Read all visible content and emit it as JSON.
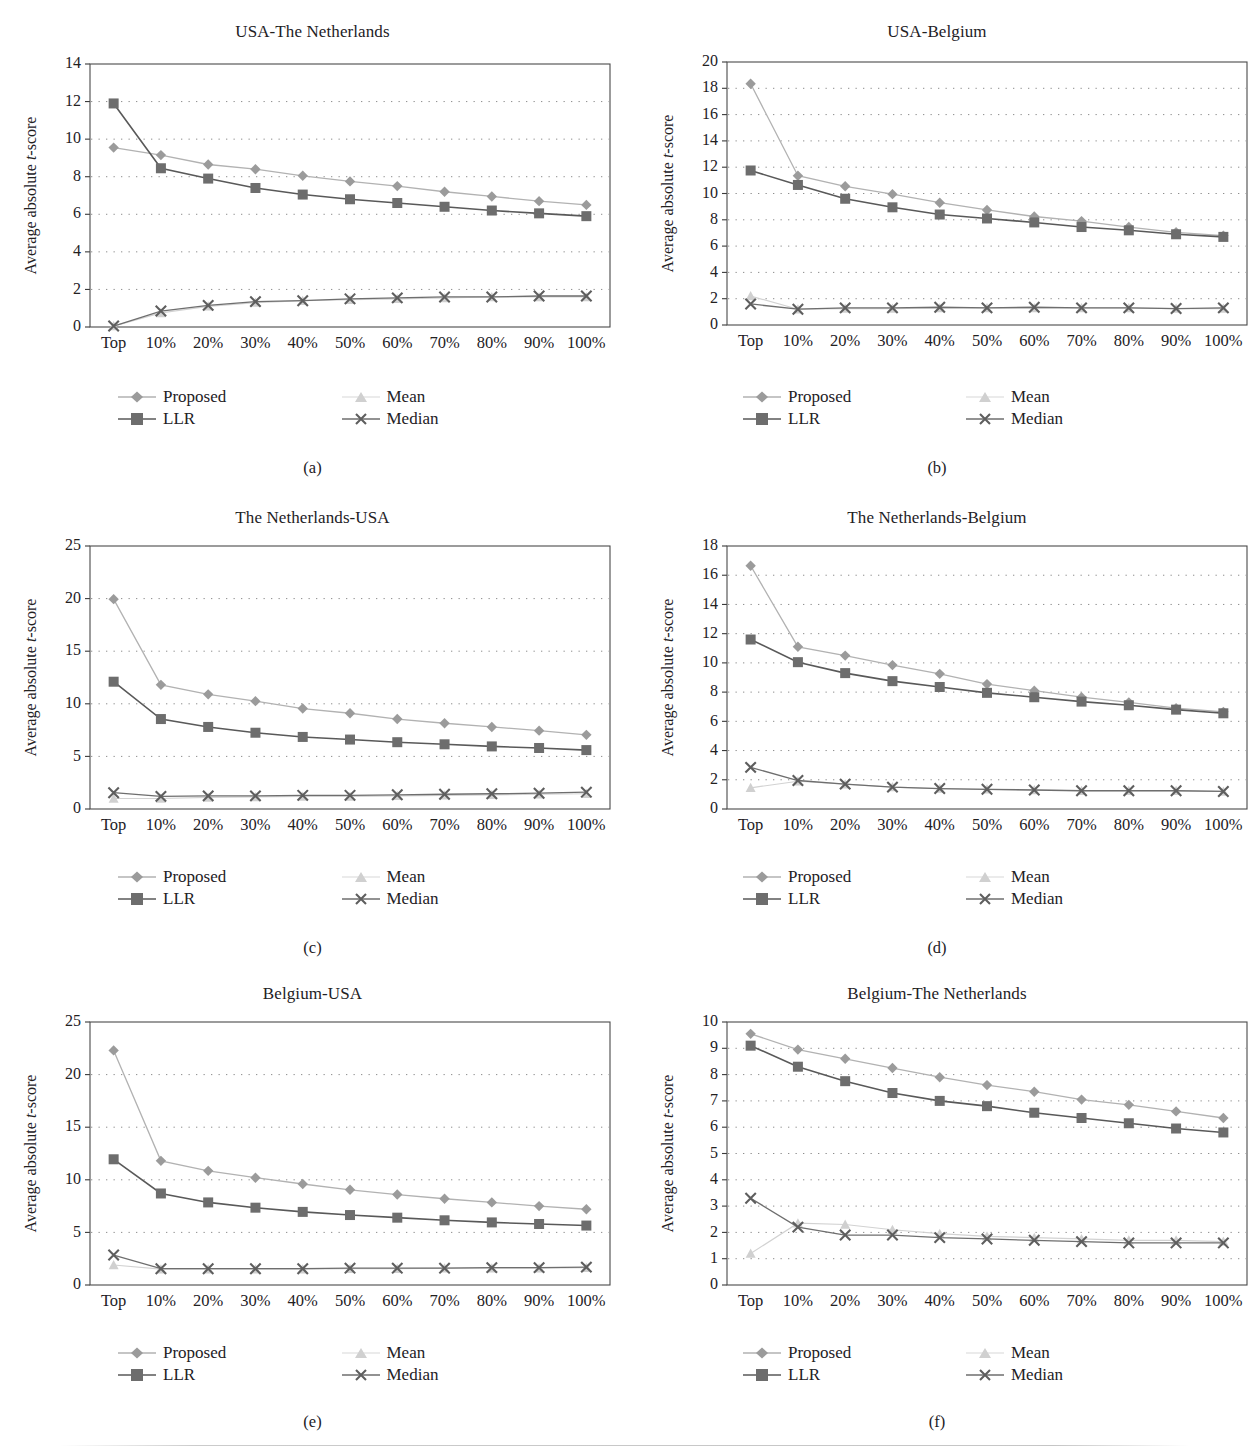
{
  "figure": {
    "y_axis_title_prefix": "Average absolute ",
    "y_axis_title_italic": "t",
    "y_axis_title_suffix": "-score",
    "legend": {
      "proposed": "Proposed",
      "llr": "LLR",
      "mean": "Mean",
      "median": "Median"
    },
    "colors": {
      "proposed": "#9b9b9b",
      "llr": "#6d6d6d",
      "mean": "#d0d0d0",
      "median": "#5e5e5e",
      "frame": "#4a4a4a",
      "grid": "#8d8d8d",
      "text": "#23211f"
    },
    "categories": [
      "Top",
      "10%",
      "20%",
      "30%",
      "40%",
      "50%",
      "60%",
      "70%",
      "80%",
      "90%",
      "100%"
    ],
    "captions": [
      "(a)",
      "(b)",
      "(c)",
      "(d)",
      "(e)",
      "(f)"
    ]
  },
  "chart_data": [
    {
      "type": "line",
      "panel": "a",
      "caption": "(a)",
      "title": "USA-The Netherlands",
      "xlabel": "",
      "ylabel": "Average absolute t-score",
      "ylim": [
        0,
        14
      ],
      "yticks": [
        0,
        2,
        4,
        6,
        8,
        10,
        12,
        14
      ],
      "grid": true,
      "legend_position": "below",
      "categories": [
        "Top",
        "10%",
        "20%",
        "30%",
        "40%",
        "50%",
        "60%",
        "70%",
        "80%",
        "90%",
        "100%"
      ],
      "series": [
        {
          "name": "Proposed",
          "values": [
            9.55,
            9.15,
            8.65,
            8.4,
            8.05,
            7.75,
            7.5,
            7.2,
            6.95,
            6.7,
            6.5
          ]
        },
        {
          "name": "LLR",
          "values": [
            11.9,
            8.45,
            7.9,
            7.4,
            7.05,
            6.8,
            6.6,
            6.4,
            6.2,
            6.05,
            5.9
          ]
        },
        {
          "name": "Mean",
          "values": [
            0.05,
            0.75,
            1.1,
            1.3,
            1.4,
            1.45,
            1.5,
            1.55,
            1.6,
            1.6,
            1.6
          ]
        },
        {
          "name": "Median",
          "values": [
            0.05,
            0.85,
            1.15,
            1.35,
            1.4,
            1.5,
            1.55,
            1.6,
            1.6,
            1.65,
            1.65
          ]
        }
      ]
    },
    {
      "type": "line",
      "panel": "b",
      "caption": "(b)",
      "title": "USA-Belgium",
      "xlabel": "",
      "ylabel": "Average absolute t-score",
      "ylim": [
        0,
        20
      ],
      "yticks": [
        0,
        2,
        4,
        6,
        8,
        10,
        12,
        14,
        16,
        18,
        20
      ],
      "grid": true,
      "legend_position": "below",
      "categories": [
        "Top",
        "10%",
        "20%",
        "30%",
        "40%",
        "50%",
        "60%",
        "70%",
        "80%",
        "90%",
        "100%"
      ],
      "series": [
        {
          "name": "Proposed",
          "values": [
            18.35,
            11.35,
            10.55,
            9.95,
            9.3,
            8.75,
            8.25,
            7.9,
            7.45,
            7.05,
            6.8
          ]
        },
        {
          "name": "LLR",
          "values": [
            11.75,
            10.65,
            9.6,
            8.95,
            8.4,
            8.1,
            7.8,
            7.45,
            7.2,
            6.9,
            6.7
          ]
        },
        {
          "name": "Mean",
          "values": [
            2.2,
            1.2,
            1.25,
            1.25,
            1.3,
            1.3,
            1.3,
            1.3,
            1.3,
            1.25,
            1.25
          ]
        },
        {
          "name": "Median",
          "values": [
            1.6,
            1.2,
            1.3,
            1.3,
            1.35,
            1.3,
            1.35,
            1.3,
            1.3,
            1.25,
            1.3
          ]
        }
      ]
    },
    {
      "type": "line",
      "panel": "c",
      "caption": "(c)",
      "title": "The Netherlands-USA",
      "xlabel": "",
      "ylabel": "Average absolute t-score",
      "ylim": [
        0,
        25
      ],
      "yticks": [
        0,
        5,
        10,
        15,
        20,
        25
      ],
      "grid": true,
      "legend_position": "below",
      "categories": [
        "Top",
        "10%",
        "20%",
        "30%",
        "40%",
        "50%",
        "60%",
        "70%",
        "80%",
        "90%",
        "100%"
      ],
      "series": [
        {
          "name": "Proposed",
          "values": [
            19.95,
            11.8,
            10.9,
            10.25,
            9.55,
            9.1,
            8.55,
            8.15,
            7.8,
            7.45,
            7.05
          ]
        },
        {
          "name": "LLR",
          "values": [
            12.1,
            8.55,
            7.8,
            7.25,
            6.85,
            6.6,
            6.35,
            6.15,
            5.95,
            5.8,
            5.6
          ]
        },
        {
          "name": "Mean",
          "values": [
            1.0,
            1.0,
            1.1,
            1.15,
            1.2,
            1.2,
            1.25,
            1.3,
            1.35,
            1.4,
            1.45
          ]
        },
        {
          "name": "Median",
          "values": [
            1.55,
            1.2,
            1.25,
            1.25,
            1.3,
            1.3,
            1.35,
            1.4,
            1.45,
            1.5,
            1.6
          ]
        }
      ]
    },
    {
      "type": "line",
      "panel": "d",
      "caption": "(d)",
      "title": "The Netherlands-Belgium",
      "xlabel": "",
      "ylabel": "Average absolute t-score",
      "ylim": [
        0,
        18
      ],
      "yticks": [
        0,
        2,
        4,
        6,
        8,
        10,
        12,
        14,
        16,
        18
      ],
      "grid": true,
      "legend_position": "below",
      "categories": [
        "Top",
        "10%",
        "20%",
        "30%",
        "40%",
        "50%",
        "60%",
        "70%",
        "80%",
        "90%",
        "100%"
      ],
      "series": [
        {
          "name": "Proposed",
          "values": [
            16.65,
            11.1,
            10.5,
            9.85,
            9.25,
            8.55,
            8.1,
            7.65,
            7.3,
            6.9,
            6.65
          ]
        },
        {
          "name": "LLR",
          "values": [
            11.6,
            10.05,
            9.3,
            8.75,
            8.35,
            7.95,
            7.65,
            7.35,
            7.1,
            6.8,
            6.55
          ]
        },
        {
          "name": "Mean",
          "values": [
            1.45,
            1.9,
            1.7,
            1.5,
            1.4,
            1.35,
            1.3,
            1.25,
            1.25,
            1.25,
            1.2
          ]
        },
        {
          "name": "Median",
          "values": [
            2.85,
            1.95,
            1.7,
            1.5,
            1.4,
            1.35,
            1.3,
            1.25,
            1.25,
            1.25,
            1.2
          ]
        }
      ]
    },
    {
      "type": "line",
      "panel": "e",
      "caption": "(e)",
      "title": "Belgium-USA",
      "xlabel": "",
      "ylabel": "Average absolute t-score",
      "ylim": [
        0,
        25
      ],
      "yticks": [
        0,
        5,
        10,
        15,
        20,
        25
      ],
      "grid": true,
      "legend_position": "below",
      "categories": [
        "Top",
        "10%",
        "20%",
        "30%",
        "40%",
        "50%",
        "60%",
        "70%",
        "80%",
        "90%",
        "100%"
      ],
      "series": [
        {
          "name": "Proposed",
          "values": [
            22.3,
            11.8,
            10.85,
            10.2,
            9.6,
            9.05,
            8.6,
            8.2,
            7.85,
            7.5,
            7.2
          ]
        },
        {
          "name": "LLR",
          "values": [
            11.95,
            8.7,
            7.85,
            7.35,
            6.95,
            6.65,
            6.4,
            6.15,
            5.95,
            5.8,
            5.65
          ]
        },
        {
          "name": "Mean",
          "values": [
            1.9,
            1.5,
            1.5,
            1.5,
            1.5,
            1.55,
            1.55,
            1.6,
            1.6,
            1.6,
            1.65
          ]
        },
        {
          "name": "Median",
          "values": [
            2.85,
            1.55,
            1.55,
            1.55,
            1.55,
            1.6,
            1.6,
            1.6,
            1.65,
            1.65,
            1.7
          ]
        }
      ]
    },
    {
      "type": "line",
      "panel": "f",
      "caption": "(f)",
      "title": "Belgium-The Netherlands",
      "xlabel": "",
      "ylabel": "Average absolute t-score",
      "ylim": [
        0,
        10
      ],
      "yticks": [
        0,
        1,
        2,
        3,
        4,
        5,
        6,
        7,
        8,
        9,
        10
      ],
      "grid": true,
      "legend_position": "below",
      "categories": [
        "Top",
        "10%",
        "20%",
        "30%",
        "40%",
        "50%",
        "60%",
        "70%",
        "80%",
        "90%",
        "100%"
      ],
      "series": [
        {
          "name": "Proposed",
          "values": [
            9.55,
            8.95,
            8.6,
            8.25,
            7.9,
            7.6,
            7.35,
            7.05,
            6.85,
            6.6,
            6.35
          ]
        },
        {
          "name": "LLR",
          "values": [
            9.1,
            8.3,
            7.75,
            7.3,
            7.0,
            6.8,
            6.55,
            6.35,
            6.15,
            5.95,
            5.8
          ]
        },
        {
          "name": "Mean",
          "values": [
            1.2,
            2.35,
            2.3,
            2.1,
            1.95,
            1.85,
            1.8,
            1.75,
            1.7,
            1.7,
            1.65
          ]
        },
        {
          "name": "Median",
          "values": [
            3.3,
            2.2,
            1.9,
            1.9,
            1.8,
            1.75,
            1.7,
            1.65,
            1.6,
            1.6,
            1.6
          ]
        }
      ]
    }
  ]
}
